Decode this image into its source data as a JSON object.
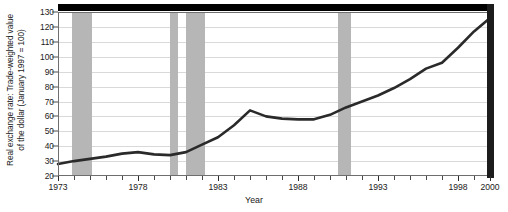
{
  "chart_data": {
    "type": "line",
    "title": "",
    "subtitle": "",
    "xlabel": "Year",
    "ylabel": "Real exchange rate: Trade-weighted value of the dollar (January 1997 = 100)",
    "ylabel_line1": "Real exchange rate: Trade-weighted value",
    "ylabel_line2": "of the dollar (January 1997 = 100)",
    "xlim": [
      1973,
      2000
    ],
    "ylim": [
      20,
      130
    ],
    "grid": true,
    "legend": "none",
    "y_ticks": [
      130,
      120,
      110,
      100,
      90,
      80,
      70,
      60,
      50,
      40,
      30,
      20
    ],
    "y_tick_labels": [
      "130",
      "120",
      "110",
      "100",
      "90",
      "80",
      "70",
      "60",
      "50",
      "40",
      "30",
      "20"
    ],
    "x_ticks": [
      1973,
      1974,
      1975,
      1976,
      1977,
      1978,
      1979,
      1980,
      1981,
      1982,
      1983,
      1984,
      1985,
      1986,
      1987,
      1988,
      1989,
      1990,
      1991,
      1992,
      1993,
      1994,
      1995,
      1996,
      1997,
      1998,
      1999,
      2000
    ],
    "x_tick_labels": [
      "1973",
      "1978",
      "1983",
      "1988",
      "1993",
      "1998",
      "2000"
    ],
    "x_labeled_ticks": [
      1973,
      1978,
      1983,
      1988,
      1993,
      1998,
      2000
    ],
    "series": [
      {
        "name": "Real trade-weighted dollar",
        "color": "#2a2a2a",
        "x": [
          1973,
          1974,
          1975,
          1976,
          1977,
          1978,
          1979,
          1980,
          1981,
          1982,
          1983,
          1984,
          1985,
          1986,
          1987,
          1988,
          1989,
          1990,
          1991,
          1992,
          1993,
          1994,
          1995,
          1996,
          1997,
          1998,
          1999,
          2000
        ],
        "values": [
          28,
          30,
          31.5,
          33,
          35,
          36,
          34.5,
          34,
          36,
          41,
          46,
          54,
          64,
          60,
          58.5,
          58,
          58,
          61,
          66,
          70,
          74,
          79,
          85,
          92,
          96,
          106,
          117,
          126
        ]
      }
    ],
    "shaded_regions": {
      "name": "recession-bands",
      "color": "#b6b6b6",
      "spans": [
        [
          1973.9,
          1975.1
        ],
        [
          1980.0,
          1980.5
        ],
        [
          1981.0,
          1982.2
        ],
        [
          1990.5,
          1991.3
        ]
      ]
    },
    "accent_colors": {
      "line": "#2a2a2a",
      "band": "#b6b6b6",
      "grid": "#d9d9d9",
      "frame": "#000000",
      "text": "#1a1a1a"
    }
  }
}
